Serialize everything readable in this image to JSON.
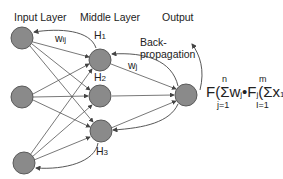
{
  "labels": {
    "input_layer": "Input Layer",
    "middle_layer": "Middle Layer",
    "output": "Output",
    "backprop_line1": "Back-",
    "backprop_line2": "propagation",
    "w_ij": "w",
    "w_ij_sub": "ij",
    "w_j": "w",
    "w_j_sub": "j",
    "h1": "H",
    "h1_sub": "1",
    "h2": "H",
    "h2_sub": "2",
    "h3": "H",
    "h3_sub": "3"
  },
  "formula": {
    "text": "F(Σw",
    "wj_sub": "j",
    "dot": "•F",
    "fj_sub": "j",
    "inner": "(Σx",
    "x_sub": "1",
    "w": "w",
    "w_sub": "ij",
    "close": "))",
    "upper1": "n",
    "lower1": "j=1",
    "upper2": "m",
    "lower2": "I=1"
  },
  "colors": {
    "node_fill": "#8a8a8a",
    "node_stroke": "#555555",
    "edge": "#444444"
  }
}
